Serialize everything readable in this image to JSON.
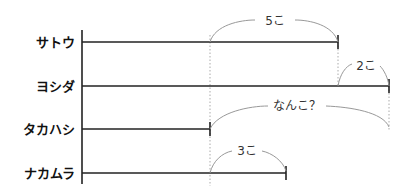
{
  "diagram": {
    "rows": [
      {
        "name": "サトウ",
        "y": 42,
        "end": 338
      },
      {
        "name": "ヨシダ",
        "y": 86,
        "end": 389
      },
      {
        "name": "タカハシ",
        "y": 129,
        "end": 210
      },
      {
        "name": "ナカムラ",
        "y": 173,
        "end": 286
      }
    ],
    "braces": [
      {
        "label": "5こ",
        "from": 210,
        "to": 338,
        "row": 0
      },
      {
        "label": "2こ",
        "from": 338,
        "to": 389,
        "row": 1
      },
      {
        "label": "なんこ？",
        "from": 210,
        "to": 389,
        "row": 2
      },
      {
        "label": "3こ",
        "from": 210,
        "to": 286,
        "row": 3
      }
    ],
    "colors": {
      "line": "#222222",
      "brace": "#999999",
      "dotted": "#aaaaaa"
    }
  }
}
